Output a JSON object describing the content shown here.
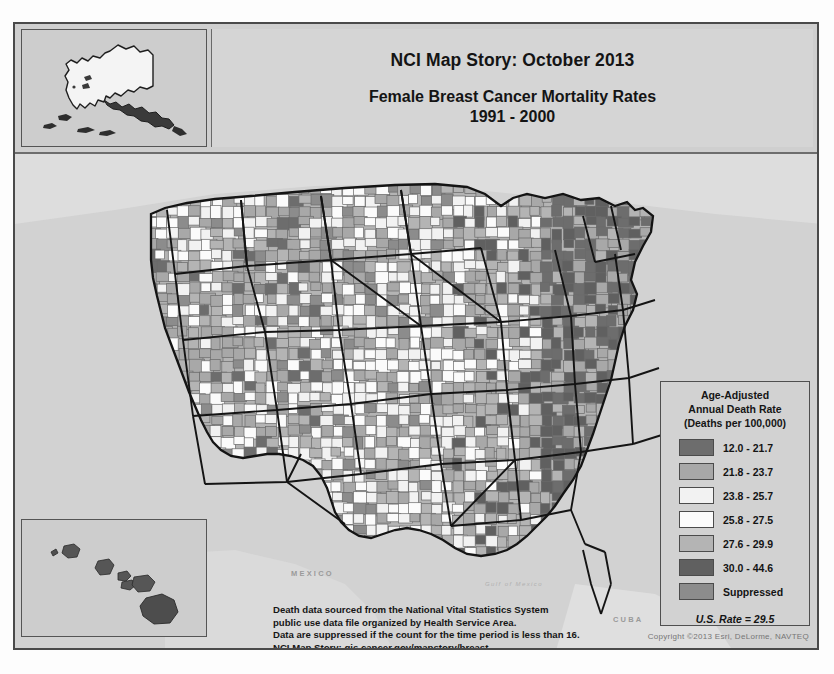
{
  "poster": {
    "title_main": "NCI Map Story: October 2013",
    "title_sub_line1": "Female Breast Cancer Mortality Rates",
    "title_sub_line2": "1991 - 2000"
  },
  "legend": {
    "title_line1": "Age-Adjusted",
    "title_line2": "Annual Death Rate",
    "title_line3": "(Deaths per 100,000)",
    "us_rate": "U.S. Rate = 29.5",
    "rows": [
      {
        "label": "12.0 - 21.7",
        "color": "#6d6d6d"
      },
      {
        "label": "21.8 - 23.7",
        "color": "#a8a8a8"
      },
      {
        "label": "23.8 - 25.7",
        "color": "#f2f2f2"
      },
      {
        "label": "25.8 - 27.5",
        "color": "#fbfbfb"
      },
      {
        "label": "27.6 - 29.9",
        "color": "#b4b4b4"
      },
      {
        "label": "30.0 - 44.6",
        "color": "#606060"
      },
      {
        "label": "Suppressed",
        "color": "#8c8c8c"
      }
    ]
  },
  "footnote": {
    "line1": "Death data sourced from the National Vital Statistics System",
    "line2": "public use data file organized by Health Service Area.",
    "line3": "Data are suppressed if the count for the time period is less than 16.",
    "line4": "NCI Map Story: gis.cancer.gov/mapstory/breast"
  },
  "copyright": "Copyright ©2013 Esri, DeLorme, NAVTEQ",
  "geo_labels": {
    "mexico": "MEXICO",
    "gulf": "Gulf of Mexico",
    "cuba": "CUBA"
  },
  "insets": {
    "alaska_name": "Alaska",
    "hawaii_name": "Hawaii"
  },
  "chart_data": {
    "type": "choropleth-map",
    "title": "Female Breast Cancer Mortality Rates 1991 - 2000",
    "subtitle": "NCI Map Story: October 2013",
    "unit": "Age-Adjusted Annual Death Rate (Deaths per 100,000)",
    "geography": "Health Service Area",
    "national_value": 29.5,
    "classes": [
      {
        "label": "12.0 - 21.7",
        "min": 12.0,
        "max": 21.7,
        "color": "#6d6d6d"
      },
      {
        "label": "21.8 - 23.7",
        "min": 21.8,
        "max": 23.7,
        "color": "#a8a8a8"
      },
      {
        "label": "23.8 - 25.7",
        "min": 23.8,
        "max": 25.7,
        "color": "#f2f2f2"
      },
      {
        "label": "25.8 - 27.5",
        "min": 25.8,
        "max": 27.5,
        "color": "#fbfbfb"
      },
      {
        "label": "27.6 - 29.9",
        "min": 27.6,
        "max": 29.9,
        "color": "#b4b4b4"
      },
      {
        "label": "30.0 - 44.6",
        "min": 30.0,
        "max": 44.6,
        "color": "#606060"
      },
      {
        "label": "Suppressed",
        "min": null,
        "max": null,
        "color": "#8c8c8c"
      }
    ]
  }
}
